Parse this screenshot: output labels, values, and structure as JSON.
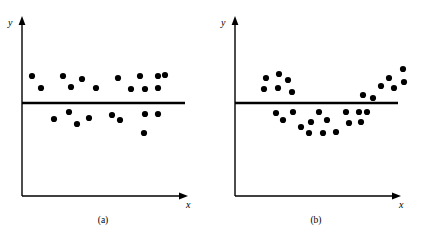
{
  "figure": {
    "background_color": "#ffffff",
    "ink_color": "#000000",
    "width": 425,
    "height": 236
  },
  "panels": [
    {
      "id": "a",
      "caption": "(a)",
      "caption_x": 103,
      "caption_y": 216,
      "x_axis_label": "x",
      "y_axis_label": "y",
      "x_label_pos": {
        "x": 186,
        "y": 200
      },
      "y_label_pos": {
        "x": 8,
        "y": 18
      },
      "axes": {
        "origin": {
          "x": 22,
          "y": 196
        },
        "x_end": {
          "x": 188,
          "y": 196
        },
        "y_end": {
          "x": 22,
          "y": 16
        },
        "line_width": 1.4
      },
      "regression_line": {
        "x1": 22,
        "y1": 103,
        "x2": 185,
        "y2": 103,
        "line_width": 2.6
      },
      "dot_radius": 3.1
    },
    {
      "id": "b",
      "caption": "(b)",
      "caption_x": 316,
      "caption_y": 216,
      "x_axis_label": "x",
      "y_axis_label": "y",
      "x_label_pos": {
        "x": 186,
        "y": 200
      },
      "y_label_pos": {
        "x": 8,
        "y": 18
      },
      "axes": {
        "origin": {
          "x": 22,
          "y": 196
        },
        "x_end": {
          "x": 188,
          "y": 196
        },
        "y_end": {
          "x": 22,
          "y": 16
        },
        "line_width": 1.4
      },
      "regression_line": {
        "x1": 22,
        "y1": 103,
        "x2": 185,
        "y2": 103,
        "line_width": 2.6
      },
      "dot_radius": 3.1
    }
  ],
  "chart_data": [
    {
      "type": "scatter",
      "title": "(a)",
      "xlabel": "x",
      "ylabel": "y",
      "description": "Residual-style scatter with points randomly and evenly distributed above and below a horizontal reference line (adequate linear fit).",
      "grid": false,
      "legend": false,
      "reference_line": {
        "orientation": "horizontal",
        "y_pixel": 103
      },
      "points_px": [
        [
          32,
          76
        ],
        [
          41,
          88
        ],
        [
          54,
          119
        ],
        [
          63,
          76
        ],
        [
          69,
          112
        ],
        [
          71,
          87
        ],
        [
          77,
          124
        ],
        [
          82,
          79
        ],
        [
          89,
          118
        ],
        [
          96,
          88
        ],
        [
          112,
          115
        ],
        [
          118,
          78
        ],
        [
          120,
          120
        ],
        [
          131,
          89
        ],
        [
          140,
          76
        ],
        [
          144,
          133
        ],
        [
          145,
          89
        ],
        [
          145,
          114
        ],
        [
          158,
          76
        ],
        [
          158,
          88
        ],
        [
          158,
          114
        ],
        [
          165,
          75
        ]
      ],
      "n_points": 22,
      "points_above_line": 11,
      "points_below_line": 11
    },
    {
      "type": "scatter",
      "title": "(b)",
      "xlabel": "x",
      "ylabel": "y",
      "description": "Residual-style scatter forming a U / curved pattern: points above the reference line at the left and right, below it in the middle (inadequate linear fit, curvature present).",
      "grid": false,
      "legend": false,
      "reference_line": {
        "orientation": "horizontal",
        "y_pixel": 103
      },
      "points_px": [
        [
          53,
          78
        ],
        [
          66,
          74
        ],
        [
          51,
          89
        ],
        [
          65,
          88
        ],
        [
          75,
          80
        ],
        [
          79,
          92
        ],
        [
          63,
          113
        ],
        [
          70,
          120
        ],
        [
          80,
          112
        ],
        [
          88,
          127
        ],
        [
          96,
          133
        ],
        [
          98,
          122
        ],
        [
          106,
          112
        ],
        [
          110,
          133
        ],
        [
          114,
          120
        ],
        [
          123,
          132
        ],
        [
          133,
          112
        ],
        [
          136,
          123
        ],
        [
          146,
          112
        ],
        [
          148,
          122
        ],
        [
          150,
          95
        ],
        [
          154,
          112
        ],
        [
          160,
          98
        ],
        [
          168,
          86
        ],
        [
          176,
          78
        ],
        [
          181,
          88
        ],
        [
          190,
          69
        ],
        [
          191,
          82
        ]
      ],
      "n_points": 28,
      "points_above_line": 14,
      "points_below_line": 14
    }
  ]
}
